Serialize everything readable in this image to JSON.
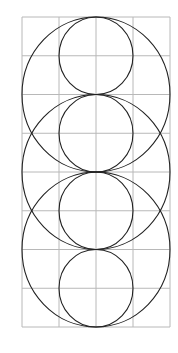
{
  "diagram": {
    "title": "",
    "background": "#ffffff",
    "grid": {
      "x0": 22,
      "y0": 17,
      "cols": 4,
      "rows": 8,
      "cell_w": 37,
      "cell_h": 38.75,
      "color": "#b8b8b8",
      "stroke_width": 1
    },
    "circle_style": {
      "color": "#222222",
      "stroke_width": 1.1
    },
    "large_circles": [
      {
        "cx": 96,
        "cy": 94.5,
        "rx": 74,
        "ry": 77.5
      },
      {
        "cx": 96,
        "cy": 172,
        "rx": 74,
        "ry": 77.5
      },
      {
        "cx": 96,
        "cy": 249.5,
        "rx": 74,
        "ry": 77.5
      }
    ],
    "small_circles": [
      {
        "cx": 96,
        "cy": 55.75,
        "rx": 37,
        "ry": 38.75
      },
      {
        "cx": 96,
        "cy": 133.25,
        "rx": 37,
        "ry": 38.75
      },
      {
        "cx": 96,
        "cy": 210.75,
        "rx": 37,
        "ry": 38.75
      },
      {
        "cx": 96,
        "cy": 288.25,
        "rx": 37,
        "ry": 38.75
      }
    ]
  }
}
